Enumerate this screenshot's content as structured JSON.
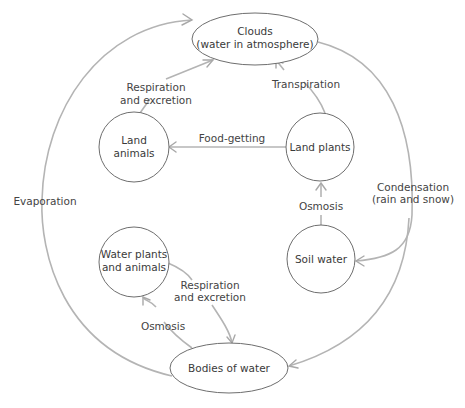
{
  "diagram": {
    "type": "water-cycle",
    "nodes": {
      "clouds": {
        "line1": "Clouds",
        "line2": "(water in atmosphere)"
      },
      "land_animals": {
        "line1": "Land",
        "line2": "animals"
      },
      "land_plants": {
        "line1": "Land plants"
      },
      "soil_water": {
        "line1": "Soil water"
      },
      "water_plants": {
        "line1": "Water plants",
        "line2": "and animals"
      },
      "bodies_of_water": {
        "line1": "Bodies of water"
      }
    },
    "edges": {
      "respiration_land": {
        "line1": "Respiration",
        "line2": "and excretion",
        "from": "Land animals",
        "to": "Clouds"
      },
      "transpiration": {
        "line1": "Transpiration",
        "from": "Land plants",
        "to": "Clouds"
      },
      "food_getting": {
        "line1": "Food-getting",
        "from": "Land plants",
        "to": "Land animals"
      },
      "osmosis_land": {
        "line1": "Osmosis",
        "from": "Soil water",
        "to": "Land plants"
      },
      "condensation": {
        "line1": "Condensation",
        "line2": "(rain and snow)",
        "from": "Clouds",
        "to": [
          "Soil water",
          "Bodies of water"
        ]
      },
      "evaporation": {
        "line1": "Evaporation",
        "from": "Bodies of water",
        "to": "Clouds"
      },
      "respiration_water": {
        "line1": "Respiration",
        "line2": "and excretion",
        "from": "Water plants and animals",
        "to": "Bodies of water"
      },
      "osmosis_water": {
        "line1": "Osmosis",
        "from": "Bodies of water",
        "to": "Water plants and animals"
      }
    },
    "colors": {
      "node_stroke": "#6e6e6e",
      "edge_stroke": "#b4b4b4",
      "text": "#3a3a3a"
    }
  }
}
